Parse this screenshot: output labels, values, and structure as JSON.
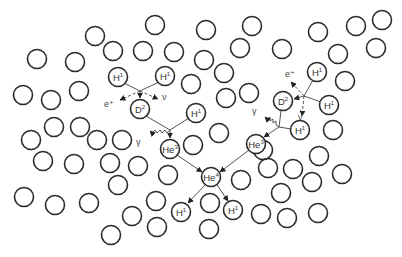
{
  "diagram": {
    "colors": {
      "background": "#ffffff",
      "circle_stroke": "#2a2a2a",
      "line": "#555555",
      "text": "#333333"
    },
    "background_circle_radius": 9.5,
    "background_circles": [
      [
        37,
        59
      ],
      [
        75,
        62
      ],
      [
        95,
        36
      ],
      [
        113,
        51
      ],
      [
        155,
        25
      ],
      [
        143,
        51
      ],
      [
        174,
        52
      ],
      [
        206,
        30
      ],
      [
        204,
        60
      ],
      [
        240,
        48
      ],
      [
        252,
        26
      ],
      [
        224,
        73
      ],
      [
        191,
        84
      ],
      [
        249,
        93
      ],
      [
        226,
        98
      ],
      [
        282,
        49
      ],
      [
        318,
        32
      ],
      [
        356,
        26
      ],
      [
        382,
        20
      ],
      [
        338,
        54
      ],
      [
        376,
        48
      ],
      [
        345,
        81
      ],
      [
        333,
        130
      ],
      [
        23,
        95
      ],
      [
        51,
        100
      ],
      [
        79,
        91
      ],
      [
        54,
        127
      ],
      [
        80,
        127
      ],
      [
        31,
        140
      ],
      [
        97,
        140
      ],
      [
        122,
        140
      ],
      [
        43,
        161
      ],
      [
        74,
        164
      ],
      [
        110,
        163
      ],
      [
        138,
        166
      ],
      [
        168,
        175
      ],
      [
        118,
        185
      ],
      [
        24,
        197
      ],
      [
        55,
        205
      ],
      [
        89,
        203
      ],
      [
        132,
        216
      ],
      [
        156,
        201
      ],
      [
        157,
        227
      ],
      [
        111,
        235
      ],
      [
        210,
        203
      ],
      [
        209,
        229
      ],
      [
        241,
        180
      ],
      [
        219,
        133
      ],
      [
        193,
        145
      ],
      [
        263,
        150
      ],
      [
        319,
        156
      ],
      [
        268,
        168
      ],
      [
        293,
        169
      ],
      [
        312,
        182
      ],
      [
        342,
        174
      ],
      [
        281,
        193
      ],
      [
        261,
        214
      ],
      [
        287,
        218
      ],
      [
        318,
        213
      ]
    ],
    "nuclei": [
      {
        "id": "h1-a",
        "symbol": "H",
        "mass": "1",
        "x": 118,
        "y": 77
      },
      {
        "id": "h1-b",
        "symbol": "H",
        "mass": "1",
        "x": 165,
        "y": 76
      },
      {
        "id": "d2-left",
        "symbol": "D",
        "mass": "2",
        "x": 140,
        "y": 109
      },
      {
        "id": "h1-c",
        "symbol": "H",
        "mass": "1",
        "x": 196,
        "y": 113
      },
      {
        "id": "he3-left",
        "symbol": "He",
        "mass": "3",
        "x": 170,
        "y": 149
      },
      {
        "id": "h1-d",
        "symbol": "H",
        "mass": "1",
        "x": 317,
        "y": 72
      },
      {
        "id": "h1-e",
        "symbol": "H",
        "mass": "1",
        "x": 329,
        "y": 105
      },
      {
        "id": "d2-right",
        "symbol": "D",
        "mass": "2",
        "x": 283,
        "y": 101
      },
      {
        "id": "h1-f",
        "symbol": "H",
        "mass": "1",
        "x": 300,
        "y": 130
      },
      {
        "id": "he3-right",
        "symbol": "He",
        "mass": "3",
        "x": 256,
        "y": 144
      },
      {
        "id": "he4",
        "symbol": "He",
        "mass": "4",
        "x": 211,
        "y": 177
      },
      {
        "id": "h1-out-left",
        "symbol": "H",
        "mass": "1",
        "x": 181,
        "y": 212
      },
      {
        "id": "h1-out-right",
        "symbol": "H",
        "mass": "1",
        "x": 233,
        "y": 210
      }
    ],
    "particle_labels": [
      {
        "id": "positron-left",
        "text": "e⁺",
        "x": 104,
        "y": 107
      },
      {
        "id": "neutrino-left",
        "text": "ν",
        "x": 162,
        "y": 100
      },
      {
        "id": "gamma-left",
        "text": "γ",
        "x": 136,
        "y": 145
      },
      {
        "id": "positron-right",
        "text": "e⁺",
        "x": 285,
        "y": 77
      },
      {
        "id": "neutrino-right",
        "text": "ν",
        "x": 298,
        "y": 120
      },
      {
        "id": "gamma-right",
        "text": "γ",
        "x": 252,
        "y": 114
      }
    ]
  }
}
